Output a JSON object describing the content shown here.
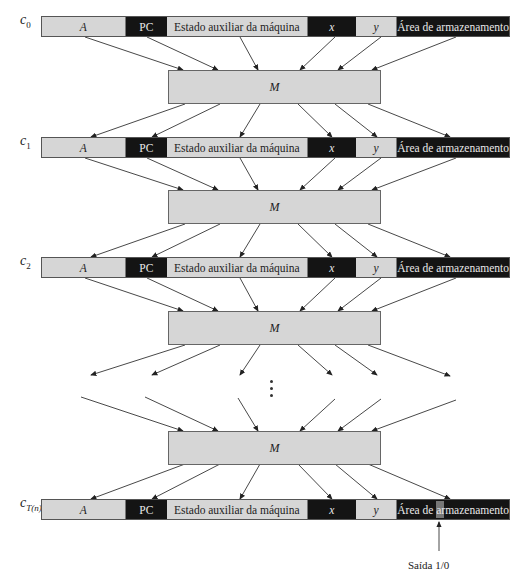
{
  "diagram": {
    "cells": {
      "a": "A",
      "pc": "PC",
      "estado": "Estado auxiliar da máquina",
      "x": "x",
      "y": "y",
      "area": "Área de armazenamento"
    },
    "rows": [
      {
        "label": "c",
        "sub": "0"
      },
      {
        "label": "c",
        "sub": "1"
      },
      {
        "label": "c",
        "sub": "2"
      },
      {
        "label": "c",
        "sub": "T(n)"
      }
    ],
    "machine_label": "M",
    "ellipsis": "⋮",
    "output_label": "Saída 1/0",
    "colors": {
      "light_cell": "#d6d6d6",
      "dark_cell": "#141414",
      "output_marker": "#777777"
    }
  }
}
